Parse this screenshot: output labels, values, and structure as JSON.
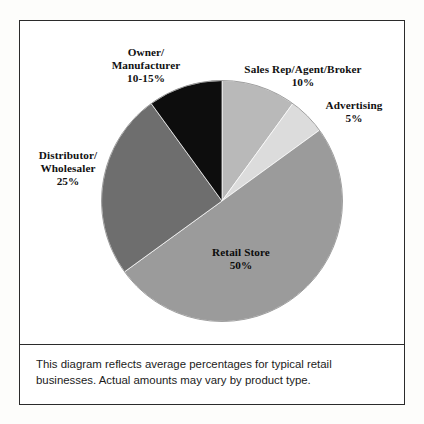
{
  "figure": {
    "caption_line1": "This diagram reflects average percentages for typical retail",
    "caption_line2": "businesses. Actual amounts may vary by product type."
  },
  "labels": {
    "owner": {
      "line1": "Owner/",
      "line2": "Manufacturer",
      "value": "10-15%"
    },
    "sales_rep": {
      "line1": "Sales Rep/Agent/Broker",
      "value": "10%"
    },
    "advertising": {
      "line1": "Advertising",
      "value": "5%"
    },
    "distributor": {
      "line1": "Distributor/",
      "line2": "Wholesaler",
      "value": "25%"
    },
    "retail_store": {
      "line1": "Retail Store",
      "value": "50%"
    }
  },
  "chart_data": {
    "type": "pie",
    "title": "",
    "subtitle": "",
    "xlabel": "",
    "ylabel": "",
    "legend_position": "none",
    "grid": false,
    "labels_placement": "outside-callout",
    "start_angle_deg": 0,
    "direction": "clockwise",
    "categories": [
      "Sales Rep/Agent/Broker",
      "Advertising",
      "Retail Store",
      "Distributor/Wholesaler",
      "Owner/Manufacturer"
    ],
    "values": [
      10,
      5,
      50,
      25,
      10
    ],
    "value_labels": [
      "10%",
      "5%",
      "50%",
      "25%",
      "10-15%"
    ],
    "colors": [
      "#b9b9b9",
      "#dcdcdc",
      "#9b9b9b",
      "#6e6e6e",
      "#0d0d0d"
    ],
    "slices": [
      {
        "name": "Sales Rep/Agent/Broker",
        "value": 10,
        "label": "10%",
        "color": "#b9b9b9",
        "start_deg": 0,
        "end_deg": 36
      },
      {
        "name": "Advertising",
        "value": 5,
        "label": "5%",
        "color": "#dcdcdc",
        "start_deg": 36,
        "end_deg": 54
      },
      {
        "name": "Retail Store",
        "value": 50,
        "label": "50%",
        "color": "#9b9b9b",
        "start_deg": 54,
        "end_deg": 234
      },
      {
        "name": "Distributor/Wholesaler",
        "value": 25,
        "label": "25%",
        "color": "#6e6e6e",
        "start_deg": 234,
        "end_deg": 324
      },
      {
        "name": "Owner/Manufacturer",
        "value": 10,
        "label": "10-15%",
        "color": "#0d0d0d",
        "start_deg": 324,
        "end_deg": 360
      }
    ],
    "annotations": [
      "This diagram reflects average percentages for typical retail businesses. Actual amounts may vary by product type."
    ]
  }
}
